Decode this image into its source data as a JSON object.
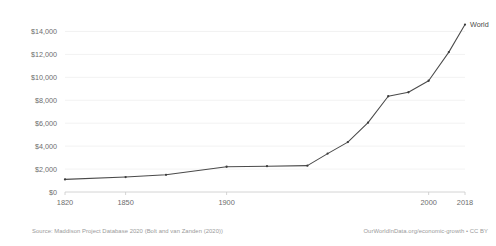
{
  "chart_data": {
    "type": "line",
    "title": "",
    "subtitle": "",
    "xlabel": "",
    "ylabel": "",
    "grid": true,
    "legend_position": "line-end-label",
    "xlim": [
      1820,
      2018
    ],
    "ylim": [
      0,
      15000
    ],
    "y_ticks": [
      0,
      2000,
      4000,
      6000,
      8000,
      10000,
      12000,
      14000
    ],
    "y_tick_labels": [
      "$0",
      "$2,000",
      "$4,000",
      "$6,000",
      "$8,000",
      "$10,000",
      "$12,000",
      "$14,000"
    ],
    "x_ticks": [
      1820,
      1850,
      1900,
      2000,
      2018
    ],
    "x_tick_labels": [
      "1820",
      "1850",
      "1900",
      "2000",
      "2018"
    ],
    "series": [
      {
        "name": "World",
        "label": "World",
        "color": "#4a4a4a",
        "x": [
          1820,
          1850,
          1870,
          1900,
          1920,
          1940,
          1950,
          1960,
          1970,
          1980,
          1990,
          2000,
          2010,
          2018
        ],
        "values": [
          1100,
          1300,
          1500,
          2200,
          2250,
          2300,
          3350,
          4350,
          6050,
          8350,
          8700,
          9700,
          12200,
          14600
        ]
      }
    ]
  },
  "notes": {
    "source": "Source: Maddison Project Database 2020 (Bolt and van Zanden (2020))",
    "attribution": "OurWorldInData.org/economic-growth • CC BY"
  }
}
